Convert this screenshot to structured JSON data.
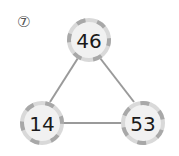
{
  "problem": {
    "number_label": "⑦"
  },
  "diagram": {
    "type": "triangle-number-diagram",
    "nodes": [
      {
        "id": "top",
        "value": "46",
        "cx": 89,
        "cy": 40
      },
      {
        "id": "bottom-left",
        "value": "14",
        "cx": 42,
        "cy": 123
      },
      {
        "id": "bottom-right",
        "value": "53",
        "cx": 143,
        "cy": 123
      }
    ],
    "edges": [
      {
        "from": "top",
        "to": "bottom-left"
      },
      {
        "from": "top",
        "to": "bottom-right"
      },
      {
        "from": "bottom-left",
        "to": "bottom-right"
      }
    ],
    "colors": {
      "edge": "#9a9a9a",
      "node_fill": "#f1f1f1",
      "ring_light": "#d9d9d9",
      "ring_dark": "#a8a8a8",
      "text": "#1a1a1a"
    }
  }
}
